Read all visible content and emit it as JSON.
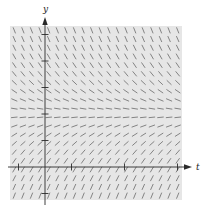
{
  "chart_data": {
    "type": "slope_field",
    "title": "",
    "xlabel": "t",
    "ylabel": "y",
    "equation_form": "dy/dt = k (E - y)",
    "equilibrium_y": 2,
    "k": 1.6,
    "xlim": [
      -0.5,
      2.75
    ],
    "ylim": [
      -1.25,
      5.0
    ],
    "x_ticks": [
      -0.5,
      0.5,
      1.5,
      2.5
    ],
    "y_ticks": [
      -1,
      1,
      2,
      3,
      4,
      5
    ],
    "tick_labels_shown": false,
    "grid": false,
    "legend": null,
    "field_grid": {
      "cols": 20,
      "rows": 20
    },
    "colors": {
      "background_panel": "#e6e6e6",
      "segment": "#6a6a6a",
      "axis": "#2a2a2a",
      "equilibrium_segment": "#4a4a4a"
    }
  },
  "labels": {
    "x_axis": "t",
    "y_axis": "y"
  }
}
